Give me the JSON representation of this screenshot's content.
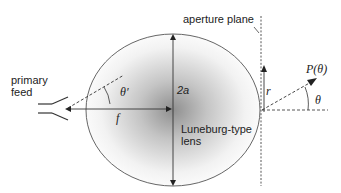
{
  "diagram": {
    "type": "Luneburg lens antenna schematic",
    "labels": {
      "primary_feed_line1": "primary",
      "primary_feed_line2": "feed",
      "theta_prime": "θ′",
      "focal_length": "f",
      "diameter": "2a",
      "lens_line1": "Luneburg-type",
      "lens_line2": "lens",
      "aperture_plane": "aperture plane",
      "radius": "r",
      "pattern": "P(θ)",
      "theta": "θ"
    },
    "colors": {
      "line": "#333333",
      "shading_center": "#9a9a9a",
      "background": "#ffffff"
    }
  }
}
